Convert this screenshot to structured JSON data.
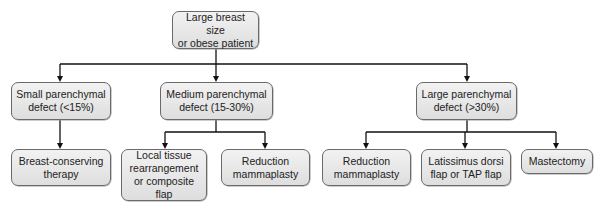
{
  "diagram": {
    "type": "flowchart",
    "root": {
      "id": "root",
      "label": "Large breast size\nor obese patient"
    },
    "level1": [
      {
        "id": "small",
        "label": "Small parenchymal\ndefect (<15%)"
      },
      {
        "id": "medium",
        "label": "Medium parenchymal\ndefect (15-30%)"
      },
      {
        "id": "large",
        "label": "Large parenchymal\ndefect (>30%)"
      }
    ],
    "level2": [
      {
        "id": "bct",
        "parent": "small",
        "label": "Breast-conserving\ntherapy"
      },
      {
        "id": "local",
        "parent": "medium",
        "label": "Local tissue\nrearrangement\nor composite flap"
      },
      {
        "id": "redm1",
        "parent": "medium",
        "label": "Reduction\nmammaplasty"
      },
      {
        "id": "redm2",
        "parent": "large",
        "label": "Reduction\nmammaplasty"
      },
      {
        "id": "ld",
        "parent": "large",
        "label": "Latissimus dorsi\nflap or TAP flap"
      },
      {
        "id": "mast",
        "parent": "large",
        "label": "Mastectomy"
      }
    ],
    "edges": [
      [
        "root",
        "small"
      ],
      [
        "root",
        "medium"
      ],
      [
        "root",
        "large"
      ],
      [
        "small",
        "bct"
      ],
      [
        "medium",
        "local"
      ],
      [
        "medium",
        "redm1"
      ],
      [
        "large",
        "redm2"
      ],
      [
        "large",
        "ld"
      ],
      [
        "large",
        "mast"
      ]
    ],
    "colors": {
      "box_fill": "#e8e8e8",
      "box_border": "#6a6a6a",
      "line": "#111111",
      "text": "#222222"
    }
  }
}
